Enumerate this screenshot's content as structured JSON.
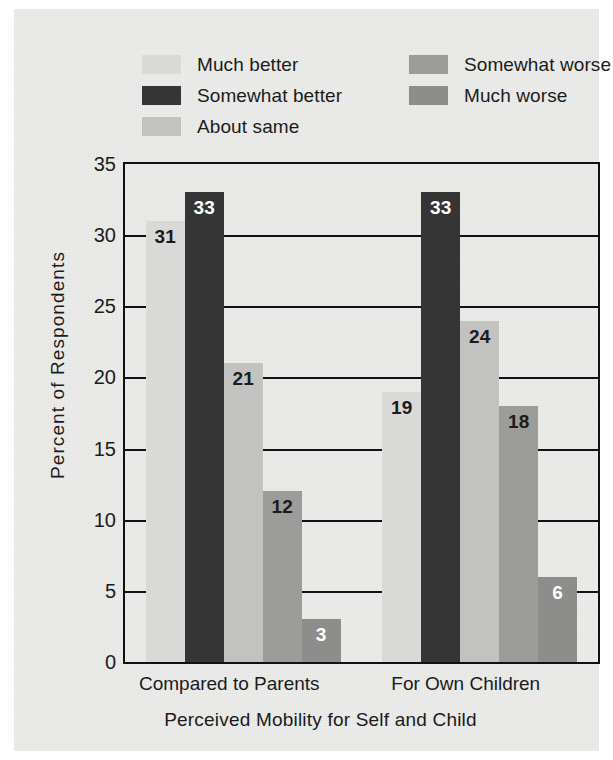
{
  "chart_data": {
    "type": "bar",
    "title": "",
    "xlabel": "Perceived Mobility for Self and Child",
    "ylabel": "Percent of Respondents",
    "ylim": [
      0,
      35
    ],
    "ytick_step": 5,
    "yticks": [
      "35",
      "30",
      "25",
      "20",
      "15",
      "10",
      "5",
      "0"
    ],
    "grid": true,
    "grid_axis": "y",
    "legend_position": "top",
    "categories": [
      "Compared to Parents",
      "For Own Children"
    ],
    "series": [
      {
        "name": "Much better",
        "color": "#d9d9d7",
        "label_color": "#1b1b1b",
        "values": [
          31,
          19
        ]
      },
      {
        "name": "Somewhat better",
        "color": "#353535",
        "label_color": "#ffffff",
        "values": [
          33,
          33
        ]
      },
      {
        "name": "About same",
        "color": "#c2c2c0",
        "label_color": "#1b1b1b",
        "values": [
          21,
          24
        ]
      },
      {
        "name": "Somewhat worse",
        "color": "#9c9c9a",
        "label_color": "#1b1b1b",
        "values": [
          12,
          18
        ]
      },
      {
        "name": "Much worse",
        "color": "#8d8d8b",
        "label_color": "#ffffff",
        "values": [
          3,
          6
        ]
      }
    ]
  },
  "legend": {
    "columns": [
      [
        {
          "label": "Much better",
          "color": "#d9d9d7"
        },
        {
          "label": "Somewhat better",
          "color": "#353535"
        },
        {
          "label": "About same",
          "color": "#c2c2c0"
        }
      ],
      [
        {
          "label": "Somewhat worse",
          "color": "#9c9c9a"
        },
        {
          "label": "Much worse",
          "color": "#8d8d8b"
        }
      ]
    ]
  },
  "colors": {
    "page_background": "#ececea",
    "axis": "#111111",
    "text": "#1b1b1b"
  }
}
